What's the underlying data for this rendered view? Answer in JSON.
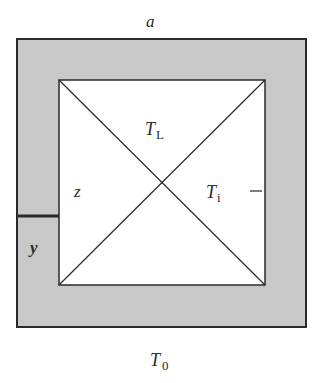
{
  "diagram": {
    "labels": {
      "top": "a",
      "upper_triangle": "T",
      "upper_triangle_sub": "L",
      "left_triangle": "z",
      "right_triangle": "T",
      "right_triangle_sub": "i",
      "left_wall_lower": "y",
      "bottom": "T",
      "bottom_sub": "0"
    },
    "colors": {
      "wall_fill": "#c8c8c8",
      "stroke": "#2a2a2a",
      "interior": "#ffffff"
    }
  }
}
